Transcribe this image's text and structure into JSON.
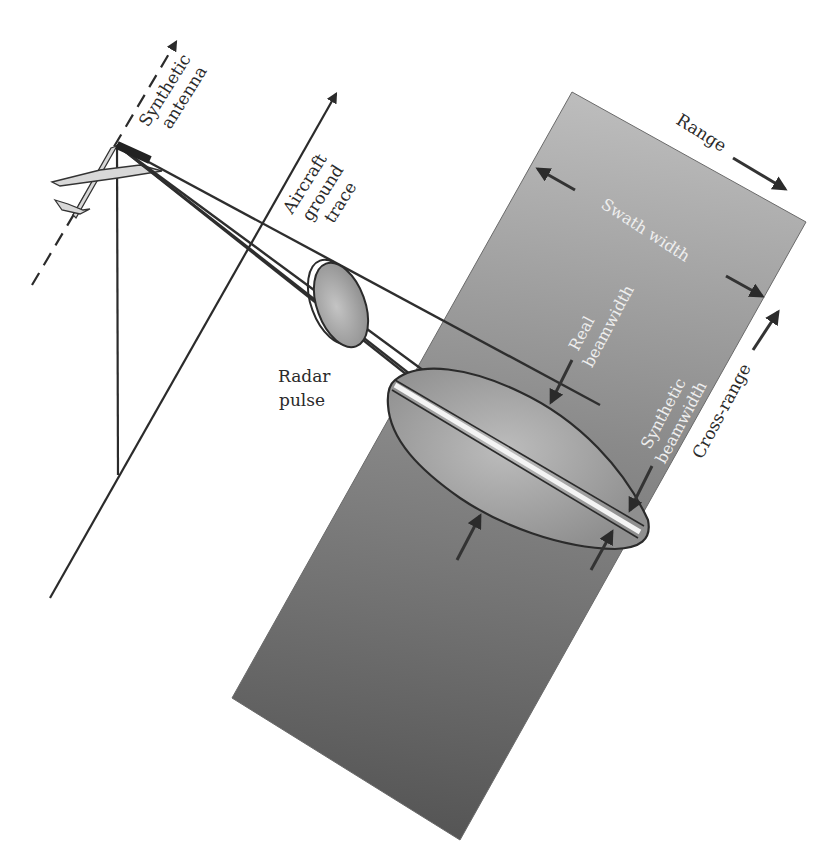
{
  "figure": {
    "colors": {
      "background": "#ffffff",
      "line": "#2b2b2b",
      "swath_light": "#b8b8b8",
      "swath_dark": "#5c5c5c",
      "footprint": "#a9a9a9",
      "pulse": "#a8a8a8",
      "light_text": "#eeeeee"
    }
  },
  "labels": {
    "synthetic_antenna_1": "Synthetic",
    "synthetic_antenna_2": "antenna",
    "ground_trace_1": "Aircraft",
    "ground_trace_2": "ground",
    "ground_trace_3": "trace",
    "range": "Range",
    "swath_width": "Swath width",
    "real_beamwidth_1": "Real",
    "real_beamwidth_2": "beamwidth",
    "radar_pulse_1": "Radar",
    "radar_pulse_2": "pulse",
    "synthetic_beamwidth_1": "Synthetic",
    "synthetic_beamwidth_2": "beamwidth",
    "cross_range": "Cross-range"
  },
  "elements": {
    "aircraft": "aircraft-icon",
    "flight_path": "dashed-arrow",
    "ground_trace": "solid-arrow",
    "nadir_line": "vertical-line",
    "beam_lines": 4,
    "radar_pulse": "ellipse",
    "real_beam_footprint": "ellipse",
    "synthetic_beam_strip": "thin-strip",
    "swath": "gray-rectangle"
  }
}
